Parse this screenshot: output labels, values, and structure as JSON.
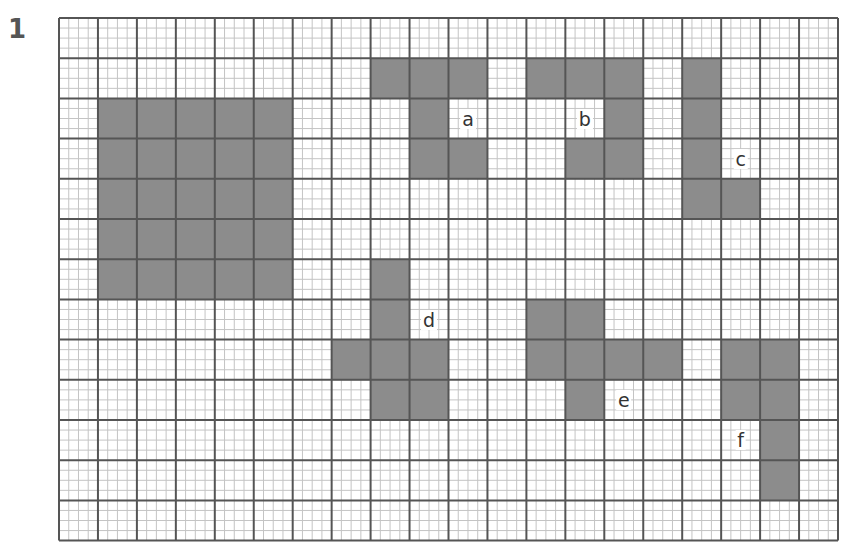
{
  "problem_number": "1",
  "grid": {
    "cols": 20,
    "rows": 13,
    "cell_width": 38.95,
    "cell_height": 40.2,
    "minor_divisions": 4,
    "major_line_color": "#555555",
    "minor_line_color": "#c4c4c4",
    "fill_color": "#8c8c8c"
  },
  "shapes": [
    {
      "id": "square",
      "label": "",
      "cells": [
        [
          1,
          2
        ],
        [
          2,
          2
        ],
        [
          3,
          2
        ],
        [
          4,
          2
        ],
        [
          5,
          2
        ],
        [
          1,
          3
        ],
        [
          2,
          3
        ],
        [
          3,
          3
        ],
        [
          4,
          3
        ],
        [
          5,
          3
        ],
        [
          1,
          4
        ],
        [
          2,
          4
        ],
        [
          3,
          4
        ],
        [
          4,
          4
        ],
        [
          5,
          4
        ],
        [
          1,
          5
        ],
        [
          2,
          5
        ],
        [
          3,
          5
        ],
        [
          4,
          5
        ],
        [
          5,
          5
        ],
        [
          1,
          6
        ],
        [
          2,
          6
        ],
        [
          3,
          6
        ],
        [
          4,
          6
        ],
        [
          5,
          6
        ]
      ]
    },
    {
      "id": "a",
      "label": "a",
      "label_cell": [
        10,
        2
      ],
      "cells": [
        [
          8,
          1
        ],
        [
          9,
          1
        ],
        [
          10,
          1
        ],
        [
          9,
          2
        ],
        [
          9,
          3
        ],
        [
          10,
          3
        ]
      ]
    },
    {
      "id": "b",
      "label": "b",
      "label_cell": [
        13,
        2
      ],
      "cells": [
        [
          12,
          1
        ],
        [
          13,
          1
        ],
        [
          14,
          1
        ],
        [
          14,
          2
        ],
        [
          13,
          3
        ],
        [
          14,
          3
        ]
      ]
    },
    {
      "id": "c",
      "label": "c",
      "label_cell": [
        17,
        3
      ],
      "cells": [
        [
          16,
          1
        ],
        [
          16,
          2
        ],
        [
          16,
          3
        ],
        [
          16,
          4
        ],
        [
          17,
          4
        ]
      ]
    },
    {
      "id": "d",
      "label": "d",
      "label_cell": [
        9,
        7
      ],
      "cells": [
        [
          8,
          6
        ],
        [
          8,
          7
        ],
        [
          7,
          8
        ],
        [
          8,
          8
        ],
        [
          9,
          8
        ],
        [
          8,
          9
        ],
        [
          9,
          9
        ]
      ]
    },
    {
      "id": "e",
      "label": "e",
      "label_cell": [
        14,
        9
      ],
      "cells": [
        [
          12,
          7
        ],
        [
          13,
          7
        ],
        [
          12,
          8
        ],
        [
          13,
          8
        ],
        [
          14,
          8
        ],
        [
          15,
          8
        ],
        [
          13,
          9
        ]
      ]
    },
    {
      "id": "f",
      "label": "f",
      "label_cell": [
        17,
        10
      ],
      "cells": [
        [
          17,
          8
        ],
        [
          18,
          8
        ],
        [
          17,
          9
        ],
        [
          18,
          9
        ],
        [
          18,
          10
        ],
        [
          18,
          11
        ]
      ]
    }
  ]
}
